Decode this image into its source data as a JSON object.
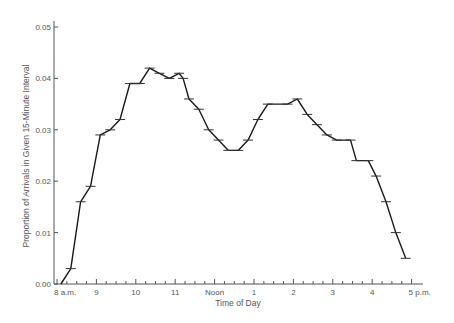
{
  "chart_data": {
    "type": "line",
    "title": "",
    "xlabel": "Time of Day",
    "ylabel": "Proportion of Arrivals in Given 15-Minute Interval",
    "ylim": [
      0,
      0.05
    ],
    "yticks": [
      "0.00",
      "0.01",
      "0.02",
      "0.03",
      "0.04",
      "0.05"
    ],
    "xticks": [
      "8 a.m.",
      "9",
      "10",
      "11",
      "Noon",
      "1",
      "2",
      "3",
      "4",
      "5 p.m."
    ],
    "x_minor_ticks_per_hour": 4,
    "grid": false,
    "legend": null,
    "series": [
      {
        "name": "Arrivals",
        "x_hours": [
          8.1,
          8.35,
          8.6,
          8.85,
          9.1,
          9.35,
          9.6,
          9.85,
          10.1,
          10.35,
          10.6,
          10.85,
          11.1,
          11.2,
          11.35,
          11.6,
          11.85,
          12.1,
          12.35,
          12.6,
          12.85,
          13.1,
          13.35,
          13.85,
          14.1,
          14.35,
          14.6,
          14.85,
          15.1,
          15.45,
          15.6,
          15.9,
          16.1,
          16.35,
          16.6,
          16.85
        ],
        "values": [
          0.0,
          0.003,
          0.016,
          0.019,
          0.029,
          0.03,
          0.032,
          0.039,
          0.039,
          0.042,
          0.041,
          0.04,
          0.041,
          0.04,
          0.036,
          0.034,
          0.03,
          0.028,
          0.026,
          0.026,
          0.028,
          0.032,
          0.035,
          0.035,
          0.036,
          0.033,
          0.031,
          0.029,
          0.028,
          0.028,
          0.024,
          0.024,
          0.021,
          0.016,
          0.01,
          0.005
        ],
        "markers": [
          false,
          true,
          true,
          true,
          true,
          true,
          true,
          true,
          true,
          true,
          true,
          true,
          true,
          true,
          true,
          true,
          true,
          true,
          true,
          true,
          true,
          true,
          true,
          true,
          true,
          true,
          true,
          true,
          true,
          true,
          true,
          true,
          true,
          true,
          true,
          true
        ]
      }
    ]
  }
}
